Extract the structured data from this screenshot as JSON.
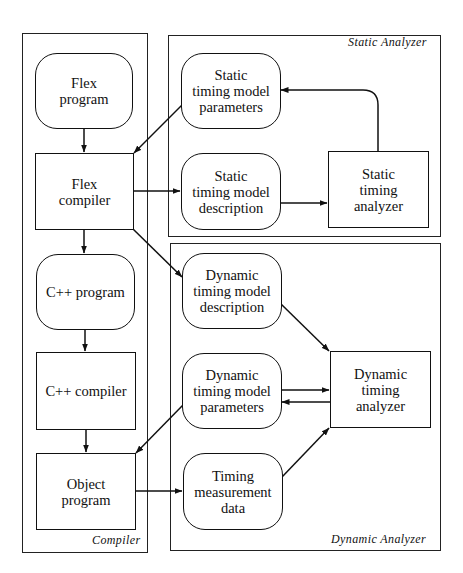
{
  "groups": {
    "compiler": {
      "label": "Compiler"
    },
    "static_analyzer": {
      "label": "Static Analyzer"
    },
    "dynamic_analyzer": {
      "label": "Dynamic Analyzer"
    }
  },
  "nodes": {
    "flex_program": {
      "label": "Flex\nprogram",
      "shape": "rounded"
    },
    "flex_compiler": {
      "label": "Flex\ncompiler",
      "shape": "rectangle"
    },
    "cpp_program": {
      "label": "C++ program",
      "shape": "rounded"
    },
    "cpp_compiler": {
      "label": "C++ compiler",
      "shape": "rectangle"
    },
    "object_program": {
      "label": "Object\nprogram",
      "shape": "rectangle"
    },
    "static_params": {
      "label": "Static\ntiming model\nparameters",
      "shape": "rounded"
    },
    "static_description": {
      "label": "Static\ntiming model\ndescription",
      "shape": "rounded"
    },
    "static_analyzer": {
      "label": "Static\ntiming\nanalyzer",
      "shape": "rectangle"
    },
    "dynamic_description": {
      "label": "Dynamic\ntiming model\ndescription",
      "shape": "rounded"
    },
    "dynamic_params": {
      "label": "Dynamic\ntiming model\nparameters",
      "shape": "rounded"
    },
    "timing_data": {
      "label": "Timing\nmeasurement\ndata",
      "shape": "rounded"
    },
    "dynamic_analyzer": {
      "label": "Dynamic\ntiming\nanalyzer",
      "shape": "rectangle"
    }
  },
  "edges": [
    {
      "from": "flex_program",
      "to": "flex_compiler"
    },
    {
      "from": "flex_compiler",
      "to": "cpp_program"
    },
    {
      "from": "cpp_program",
      "to": "cpp_compiler"
    },
    {
      "from": "cpp_compiler",
      "to": "object_program"
    },
    {
      "from": "static_params",
      "to": "flex_compiler"
    },
    {
      "from": "flex_compiler",
      "to": "static_description"
    },
    {
      "from": "static_description",
      "to": "static_analyzer"
    },
    {
      "from": "static_analyzer",
      "to": "static_params"
    },
    {
      "from": "flex_compiler",
      "to": "dynamic_description"
    },
    {
      "from": "dynamic_description",
      "to": "dynamic_analyzer"
    },
    {
      "from": "dynamic_params",
      "to": "dynamic_analyzer"
    },
    {
      "from": "dynamic_analyzer",
      "to": "dynamic_params"
    },
    {
      "from": "dynamic_params",
      "to": "object_program"
    },
    {
      "from": "object_program",
      "to": "timing_data"
    },
    {
      "from": "timing_data",
      "to": "dynamic_analyzer"
    }
  ],
  "colors": {
    "stroke": "#111111",
    "background": "#ffffff"
  }
}
